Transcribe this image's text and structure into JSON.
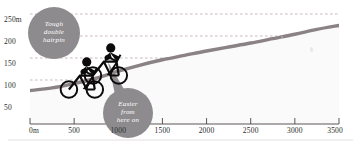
{
  "chart_data": {
    "type": "area",
    "title": "",
    "xlabel": "",
    "ylabel": "",
    "xlim": [
      0,
      3500
    ],
    "ylim": [
      0,
      250
    ],
    "grid": true,
    "legend": "none",
    "series": [
      {
        "name": "Route elevation profile",
        "x": [
          0,
          250,
          500,
          750,
          1000,
          1250,
          1500,
          1750,
          2000,
          2250,
          2500,
          2750,
          3000,
          3250,
          3500
        ],
        "values": [
          76,
          82,
          92,
          104,
          120,
          134,
          146,
          156,
          166,
          175,
          184,
          194,
          204,
          215,
          224
        ]
      }
    ],
    "x_ticks": [
      0,
      500,
      1000,
      1500,
      2000,
      2500,
      3000,
      3500
    ],
    "x_tick_labels": [
      "0m",
      "500",
      "1000",
      "1500",
      "2000",
      "2500",
      "3000",
      "3500"
    ],
    "y_ticks": [
      50,
      100,
      150,
      200,
      250
    ],
    "y_tick_labels": [
      "50",
      "100",
      "150",
      "200",
      "250m"
    ],
    "annotations": [
      {
        "id": "hairpin",
        "text": "Tough double hairpin",
        "lines": [
          "Tough",
          "double",
          "hairpin"
        ],
        "at_x": 560,
        "at_y": 205
      },
      {
        "id": "easier",
        "text": "Easier from here on",
        "lines": [
          "Easier",
          "from",
          "here on"
        ],
        "at_x": 1180,
        "at_y": 35
      }
    ],
    "markers": [
      {
        "id": "cyclist-rear",
        "at_x": 620,
        "at_y": 128
      },
      {
        "id": "cyclist-front",
        "at_x": 900,
        "at_y": 150
      }
    ]
  },
  "colors": {
    "profile_line": "#8a8285",
    "bubble": "#8e8b8e",
    "bubble_text": "#ffffff",
    "gridline": "#b9a9ac",
    "axis": "#4a4446",
    "tick_text": "#2b2b2b",
    "background": "#ffffff",
    "fill_below": "#fbfafa",
    "footer_rule": "#e2dede"
  }
}
